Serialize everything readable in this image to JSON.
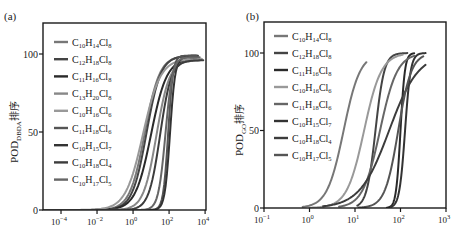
{
  "chart_data": [
    {
      "panel_label": "(a)",
      "type": "line",
      "title": "",
      "xlabel": "",
      "ylabel": "POD_DBDA 排序",
      "ylabel_main": "POD",
      "ylabel_sub": "DBDA",
      "ylabel_suffix": "排序",
      "xscale": "log",
      "xlim_log10": [
        -5,
        4.2
      ],
      "ylim": [
        0,
        115
      ],
      "x_ticks": [
        {
          "exp": -4,
          "label": "10",
          "sup": "−4"
        },
        {
          "exp": -2,
          "label": "10",
          "sup": "−2"
        },
        {
          "exp": 0,
          "label": "10",
          "sup": "0"
        },
        {
          "exp": 2,
          "label": "10",
          "sup": "2"
        },
        {
          "exp": 4,
          "label": "10",
          "sup": "4"
        }
      ],
      "y_ticks": [
        0,
        50,
        100
      ],
      "grid": false,
      "legend_position": "upper left",
      "series": [
        {
          "name": "C10H14Cl8",
          "C": "10",
          "H": "14",
          "Cl": "8",
          "color": "#777777",
          "log_x50": 0.65,
          "slope": 1.05,
          "ymax": 99,
          "xend_log": 3.6
        },
        {
          "name": "C12H18Cl8",
          "C": "12",
          "H": "18",
          "Cl": "8",
          "color": "#444444",
          "log_x50": 0.75,
          "slope": 1.1,
          "ymax": 99,
          "xend_log": 3.6
        },
        {
          "name": "C11H16Cl8",
          "C": "11",
          "H": "16",
          "Cl": "8",
          "color": "#2a2a2a",
          "log_x50": 1.0,
          "slope": 1.0,
          "ymax": 97,
          "xend_log": 3.8
        },
        {
          "name": "C13H20Cl8",
          "C": "13",
          "H": "20",
          "Cl": "8",
          "color": "#888888",
          "log_x50": 1.3,
          "slope": 1.2,
          "ymax": 96,
          "xend_log": 3.7
        },
        {
          "name": "C10H16Cl6",
          "C": "10",
          "H": "16",
          "Cl": "6",
          "color": "#999999",
          "log_x50": 0.55,
          "slope": 0.9,
          "ymax": 97,
          "xend_log": 3.8
        },
        {
          "name": "C11H18Cl6",
          "C": "11",
          "H": "18",
          "Cl": "6",
          "color": "#555555",
          "log_x50": 1.95,
          "slope": 3.2,
          "ymax": 99,
          "xend_log": 3.5
        },
        {
          "name": "C10H15Cl7",
          "C": "10",
          "H": "15",
          "Cl": "7",
          "color": "#333333",
          "log_x50": 2.05,
          "slope": 3.0,
          "ymax": 98,
          "xend_log": 3.6
        },
        {
          "name": "C10H18Cl4",
          "C": "10",
          "H": "18",
          "Cl": "4",
          "color": "#3c3c3c",
          "log_x50": 1.5,
          "slope": 1.4,
          "ymax": 96,
          "xend_log": 3.9
        },
        {
          "name": "C10H17Cl5",
          "C": "10",
          "H": "17",
          "Cl": "5",
          "color": "#666666",
          "log_x50": 1.8,
          "slope": 2.2,
          "ymax": 98,
          "xend_log": 3.7
        }
      ]
    },
    {
      "panel_label": "(b)",
      "type": "line",
      "title": "",
      "xlabel": "",
      "ylabel": "POD_GO 排序",
      "ylabel_main": "POD",
      "ylabel_sub": "GO",
      "ylabel_suffix": "排序",
      "xscale": "log",
      "xlim_log10": [
        -1,
        3
      ],
      "ylim": [
        0,
        115
      ],
      "x_ticks": [
        {
          "exp": -1,
          "label": "10",
          "sup": "−1"
        },
        {
          "exp": 0,
          "label": "10",
          "sup": "0"
        },
        {
          "exp": 1,
          "label": "10",
          "sup": "1"
        },
        {
          "exp": 2,
          "label": "10",
          "sup": "2"
        },
        {
          "exp": 3,
          "label": "10",
          "sup": "3"
        }
      ],
      "y_ticks": [
        0,
        50,
        100
      ],
      "grid": false,
      "legend_position": "upper left",
      "series": [
        {
          "name": "C10H14Cl8",
          "C": "10",
          "H": "14",
          "Cl": "8",
          "color": "#777777",
          "log_x50": 0.75,
          "slope": 2.4,
          "ymax": 100,
          "xstart_log": -0.15,
          "xend_log": 1.25
        },
        {
          "name": "C12H18Cl8",
          "C": "12",
          "H": "18",
          "Cl": "8",
          "color": "#444444",
          "log_x50": 1.45,
          "slope": 4.5,
          "ymax": 100,
          "xstart_log": 1.05,
          "xend_log": 2.15
        },
        {
          "name": "C11H16Cl8",
          "C": "11",
          "H": "16",
          "Cl": "8",
          "color": "#2a2a2a",
          "log_x50": 2.0,
          "slope": 9.0,
          "ymax": 100,
          "xstart_log": 1.7,
          "xend_log": 2.3
        },
        {
          "name": "C10H16Cl6",
          "C": "10",
          "H": "16",
          "Cl": "6",
          "color": "#999999",
          "log_x50": 1.2,
          "slope": 2.3,
          "ymax": 100,
          "xstart_log": 0.0,
          "xend_log": 2.05
        },
        {
          "name": "C11H18Cl6",
          "C": "11",
          "H": "18",
          "Cl": "6",
          "color": "#666666",
          "log_x50": 1.55,
          "slope": 2.3,
          "ymax": 100,
          "xstart_log": 0.65,
          "xend_log": 2.3
        },
        {
          "name": "C10H15Cl7",
          "C": "10",
          "H": "15",
          "Cl": "7",
          "color": "#333333",
          "log_x50": 2.1,
          "slope": 7.0,
          "ymax": 100,
          "xstart_log": 1.8,
          "xend_log": 2.55
        },
        {
          "name": "C10H18Cl4",
          "C": "10",
          "H": "18",
          "Cl": "4",
          "color": "#3c3c3c",
          "log_x50": 1.75,
          "slope": 1.35,
          "ymax": 100,
          "xstart_log": 0.3,
          "xend_log": 2.55
        },
        {
          "name": "C10H17Cl5",
          "C": "10",
          "H": "17",
          "Cl": "5",
          "color": "#555555",
          "log_x50": 1.95,
          "slope": 3.0,
          "ymax": 100,
          "xstart_log": 1.08,
          "xend_log": 2.5
        }
      ]
    }
  ]
}
